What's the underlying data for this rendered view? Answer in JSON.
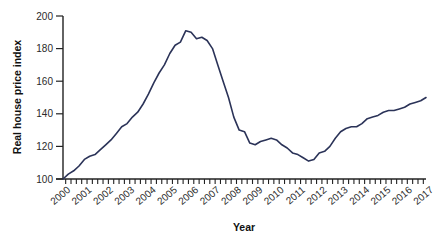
{
  "chart_data": {
    "type": "line",
    "title": "",
    "xlabel": "Year",
    "ylabel": "Real house price index",
    "ylim": [
      100,
      200
    ],
    "xlim": [
      2000,
      2017
    ],
    "grid": false,
    "legend": null,
    "y_ticks": [
      100,
      120,
      140,
      160,
      180,
      200
    ],
    "x_tick_labels": [
      "2000",
      "2001",
      "2002",
      "2003",
      "2004",
      "2005",
      "2006",
      "2007",
      "2008",
      "2009",
      "2010",
      "2011",
      "2012",
      "2013",
      "2014",
      "2015",
      "2016",
      "2017"
    ],
    "minor_ticks_per_year": 4,
    "line_color": "#2b3358",
    "series": [
      {
        "name": "Real house price index",
        "x": [
          2000.0,
          2000.25,
          2000.5,
          2000.75,
          2001.0,
          2001.25,
          2001.5,
          2001.75,
          2002.0,
          2002.25,
          2002.5,
          2002.75,
          2003.0,
          2003.25,
          2003.5,
          2003.75,
          2004.0,
          2004.25,
          2004.5,
          2004.75,
          2005.0,
          2005.25,
          2005.5,
          2005.75,
          2006.0,
          2006.25,
          2006.5,
          2006.75,
          2007.0,
          2007.25,
          2007.5,
          2007.75,
          2008.0,
          2008.25,
          2008.5,
          2008.75,
          2009.0,
          2009.25,
          2009.5,
          2009.75,
          2010.0,
          2010.25,
          2010.5,
          2010.75,
          2011.0,
          2011.25,
          2011.5,
          2011.75,
          2012.0,
          2012.25,
          2012.5,
          2012.75,
          2013.0,
          2013.25,
          2013.5,
          2013.75,
          2014.0,
          2014.25,
          2014.5,
          2014.75,
          2015.0,
          2015.25,
          2015.5,
          2015.75,
          2016.0,
          2016.25,
          2016.5,
          2016.75,
          2017.0
        ],
        "values": [
          100,
          103,
          105,
          108,
          112,
          114,
          115,
          118,
          121,
          124,
          128,
          132,
          134,
          138,
          141,
          146,
          152,
          159,
          165,
          170,
          177,
          182,
          184,
          191,
          190,
          186,
          187,
          185,
          180,
          170,
          160,
          150,
          138,
          130,
          129,
          122,
          121,
          123,
          124,
          125,
          124,
          121,
          119,
          116,
          115,
          113,
          111,
          112,
          116,
          117,
          120,
          125,
          129,
          131,
          132,
          132,
          134,
          137,
          138,
          139,
          141,
          142,
          142,
          143,
          144,
          146,
          147,
          148,
          150
        ]
      }
    ]
  }
}
